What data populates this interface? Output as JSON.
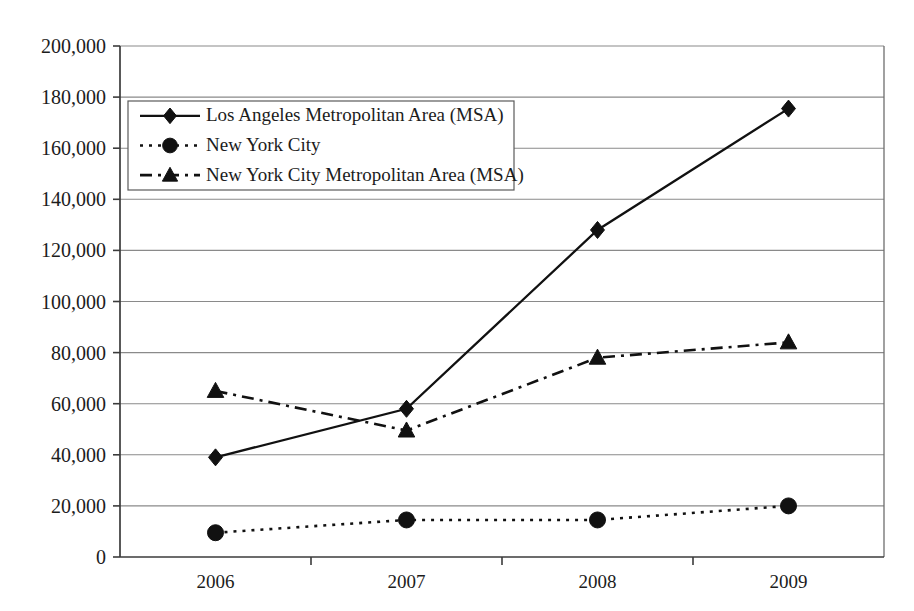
{
  "chart_data": {
    "type": "line",
    "title": "",
    "xlabel": "",
    "ylabel": "",
    "categories": [
      "2006",
      "2007",
      "2008",
      "2009"
    ],
    "ylim": [
      0,
      200000
    ],
    "ytick_values": [
      0,
      20000,
      40000,
      60000,
      80000,
      100000,
      120000,
      140000,
      160000,
      180000,
      200000
    ],
    "ytick_labels": [
      "0",
      "20,000",
      "40,000",
      "60,000",
      "80,000",
      "100,000",
      "120,000",
      "140,000",
      "160,000",
      "180,000",
      "200,000"
    ],
    "grid": true,
    "legend_position": "upper-left-inside",
    "series": [
      {
        "name": "Los Angeles Metropolitan Area (MSA)",
        "marker": "diamond",
        "linestyle": "solid",
        "color": "#111111",
        "values": [
          39000,
          58000,
          128000,
          175500
        ]
      },
      {
        "name": "New York City",
        "marker": "circle",
        "linestyle": "dotted",
        "color": "#111111",
        "values": [
          9500,
          14500,
          14500,
          20000
        ]
      },
      {
        "name": "New York City Metropolitan Area (MSA)",
        "marker": "triangle",
        "linestyle": "dashdot",
        "color": "#111111",
        "values": [
          65000,
          49500,
          78000,
          84000
        ]
      }
    ]
  },
  "legend": {
    "entries": [
      {
        "label": "Los Angeles Metropolitan Area (MSA)"
      },
      {
        "label": "New York City"
      },
      {
        "label": "New York City Metropolitan Area (MSA)"
      }
    ]
  },
  "colors": {
    "ink": "#111111",
    "grid": "#8a8a8a",
    "axis": "#3b3b3b",
    "background": "#ffffff"
  }
}
